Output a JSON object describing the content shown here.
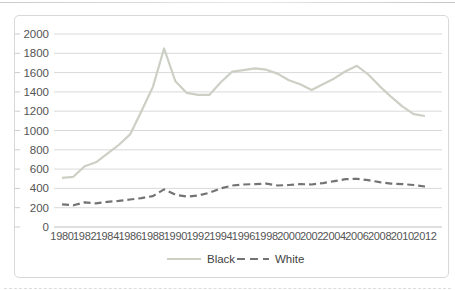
{
  "colors": {
    "background": "#ffffff",
    "chart_border": "#d8d8d8",
    "gridline": "#d9d9d9",
    "axis_line": "#bfbfbf",
    "tick": "#cccccc",
    "axis_text": "#545454",
    "legend_text": "#3f3f3f",
    "series_black": "#ccd0c4",
    "series_white": "#737373",
    "top_divider": "#bdbdbd"
  },
  "chart_data": {
    "type": "line",
    "title": "",
    "xlabel": "",
    "ylabel": "",
    "grid": true,
    "legend_position": "bottom",
    "ylim": [
      0,
      2000
    ],
    "ytick_step": 200,
    "y_tick_labels": [
      "0",
      "200",
      "400",
      "600",
      "800",
      "1000",
      "1200",
      "1400",
      "1600",
      "1800",
      "2000"
    ],
    "x": [
      1980,
      1981,
      1982,
      1983,
      1984,
      1985,
      1986,
      1987,
      1988,
      1989,
      1990,
      1991,
      1992,
      1993,
      1994,
      1995,
      1996,
      1997,
      1998,
      1999,
      2000,
      2001,
      2002,
      2003,
      2004,
      2005,
      2006,
      2007,
      2008,
      2009,
      2010,
      2011,
      2012
    ],
    "x_tick_labels": [
      "1980",
      "1982",
      "1984",
      "1986",
      "1988",
      "1990",
      "1992",
      "1994",
      "1996",
      "1998",
      "2000",
      "2002",
      "2004",
      "2006",
      "2008",
      "2010",
      "2012"
    ],
    "series": [
      {
        "name": "Black",
        "line_style": "solid",
        "color": "#ccd0c4",
        "values": [
          510,
          520,
          630,
          670,
          760,
          850,
          960,
          1200,
          1450,
          1850,
          1510,
          1390,
          1370,
          1370,
          1500,
          1610,
          1625,
          1645,
          1630,
          1590,
          1520,
          1480,
          1420,
          1480,
          1540,
          1615,
          1670,
          1580,
          1460,
          1350,
          1250,
          1170,
          1150
        ]
      },
      {
        "name": "White",
        "line_style": "dashed",
        "color": "#737373",
        "values": [
          235,
          225,
          255,
          245,
          260,
          270,
          285,
          300,
          320,
          390,
          335,
          315,
          325,
          355,
          400,
          430,
          440,
          445,
          450,
          430,
          435,
          445,
          440,
          455,
          475,
          495,
          500,
          485,
          465,
          450,
          445,
          435,
          420
        ]
      }
    ],
    "legend": [
      "Black",
      "White"
    ]
  }
}
